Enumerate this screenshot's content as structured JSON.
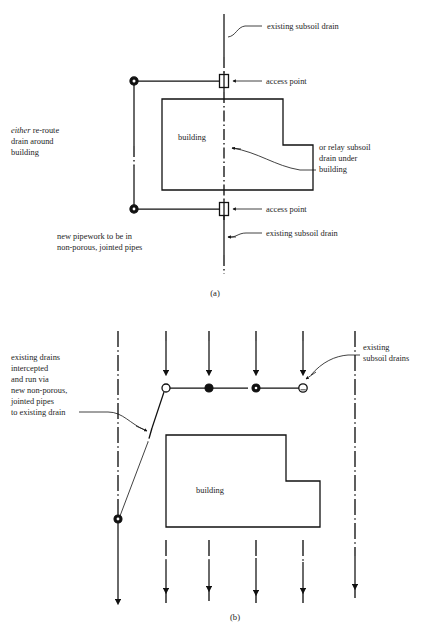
{
  "figure": {
    "panels": [
      {
        "id": "a",
        "caption": "(a)",
        "labels": {
          "existing_drain_top": "existing subsoil drain",
          "access_point_top": "access point",
          "access_point_bottom": "access point",
          "existing_drain_bottom": "existing subsoil drain",
          "reroute_emphasis": "either",
          "reroute_line1_rest": " re-route",
          "reroute_line2": "drain around",
          "reroute_line3": "building",
          "relay_line1": "or relay subsoil",
          "relay_line2": "drain under",
          "relay_line3": "building",
          "pipework_line1": "new pipework to be in",
          "pipework_line2": "non-porous, jointed pipes",
          "building": "building"
        }
      },
      {
        "id": "b",
        "caption": "(b)",
        "labels": {
          "intercept_line1": "existing drains",
          "intercept_line2": "intercepted",
          "intercept_line3": "and run via",
          "intercept_line4": "new non-porous,",
          "intercept_line5": "jointed pipes",
          "intercept_line6": "to existing drain",
          "existing_drains_line1": "existing",
          "existing_drains_line2": "subsoil drains",
          "building": "building"
        }
      }
    ],
    "colors": {
      "line": "#111111",
      "text": "#1d1d1d",
      "background": "#ffffff",
      "node_fill": "#111111",
      "node_open": "#ffffff"
    }
  }
}
